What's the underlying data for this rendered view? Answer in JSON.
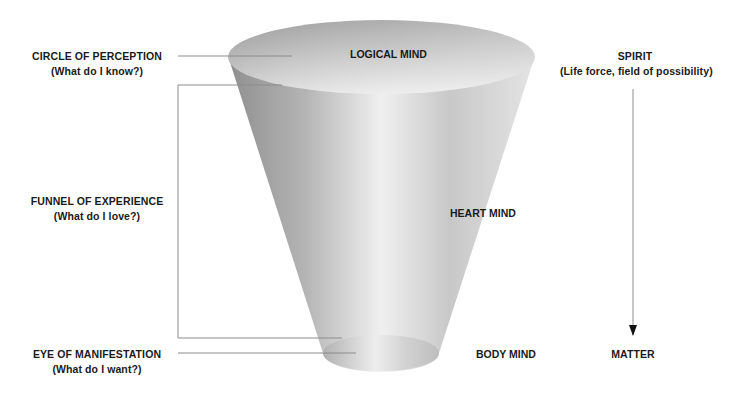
{
  "diagram": {
    "left_labels": [
      {
        "title": "CIRCLE OF PERCEPTION",
        "question": "(What do I know?)"
      },
      {
        "title": "FUNNEL OF EXPERIENCE",
        "question": "(What do I love?)"
      },
      {
        "title": "EYE OF MANIFESTATION",
        "question": "(What do I want?)"
      }
    ],
    "funnel_labels": {
      "top": "LOGICAL MIND",
      "middle": "HEART MIND",
      "bottom": "BODY MIND"
    },
    "right_axis": {
      "top_title": "SPIRIT",
      "top_subtitle": "(Life force, field of possibility)",
      "bottom_title": "MATTER",
      "arrow_direction": "down"
    },
    "colors": {
      "funnel_dark": "#9a9a9a",
      "funnel_light": "#ececec",
      "line": "#8c8c8c",
      "text": "#1a1a1a"
    }
  }
}
